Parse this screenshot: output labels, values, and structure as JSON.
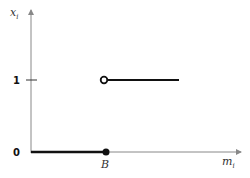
{
  "diagram": {
    "type": "step-function",
    "y_axis": {
      "label": "x",
      "subscript": "i"
    },
    "x_axis": {
      "label": "m",
      "subscript": "i"
    },
    "y_ticks": [
      {
        "label": "1",
        "value": 1
      },
      {
        "label": "0",
        "value": 0
      }
    ],
    "x_marks": [
      {
        "label": "B"
      }
    ],
    "segments": [
      {
        "from": "0",
        "to": "B",
        "y": 0,
        "end_marker": "filled"
      },
      {
        "from": "B",
        "to": "beyond",
        "y": 1,
        "start_marker": "open"
      }
    ],
    "colors": {
      "axis": "#888888",
      "function": "#111111"
    }
  }
}
